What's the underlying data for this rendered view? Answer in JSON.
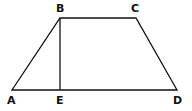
{
  "diagram": {
    "type": "trapezoid",
    "stroke_color": "#111111",
    "background": "#ffffff",
    "vertices": {
      "A": {
        "label": "A",
        "x": 12,
        "y": 90
      },
      "B": {
        "label": "B",
        "x": 60,
        "y": 18
      },
      "C": {
        "label": "C",
        "x": 136,
        "y": 18
      },
      "D": {
        "label": "D",
        "x": 177,
        "y": 90
      },
      "E": {
        "label": "E",
        "x": 60,
        "y": 90
      }
    },
    "segments": [
      "AB",
      "BC",
      "CD",
      "DA",
      "BE"
    ]
  }
}
